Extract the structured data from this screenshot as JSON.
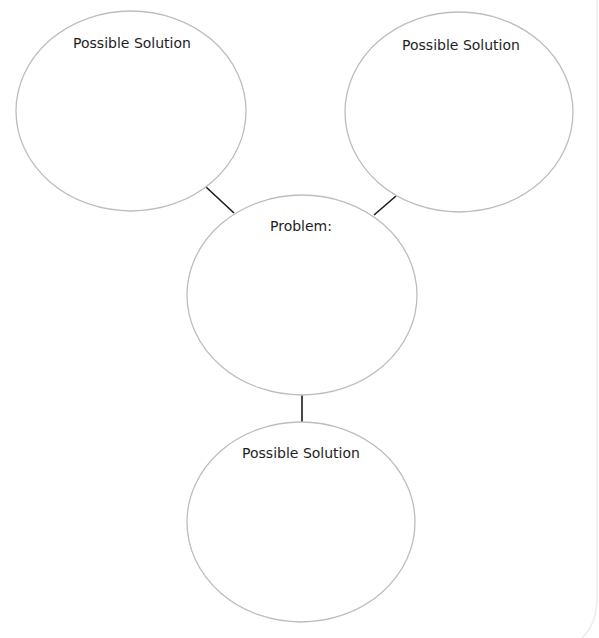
{
  "diagram": {
    "type": "problem-solution-web",
    "center_node": {
      "label": "Problem:",
      "cx": 302,
      "cy": 295,
      "rx": 115,
      "ry": 100
    },
    "solution_nodes": [
      {
        "id": "top-left",
        "label": "Possible Solution",
        "cx": 131,
        "cy": 111,
        "rx": 115,
        "ry": 100
      },
      {
        "id": "top-right",
        "label": "Possible Solution",
        "cx": 459,
        "cy": 112,
        "rx": 114,
        "ry": 100
      },
      {
        "id": "bottom",
        "label": "Possible Solution",
        "cx": 301,
        "cy": 522,
        "rx": 114,
        "ry": 100
      }
    ],
    "connectors": [
      {
        "from": "top-left",
        "x1": 206,
        "y1": 187,
        "x2": 234,
        "y2": 213
      },
      {
        "from": "top-right",
        "x1": 396,
        "y1": 196,
        "x2": 374,
        "y2": 215
      },
      {
        "from": "bottom",
        "x1": 302,
        "y1": 395,
        "x2": 302,
        "y2": 422
      }
    ],
    "colors": {
      "ellipse_stroke": "#bdbdbd",
      "connector": "#1a1a1a",
      "text": "#1e1e1e",
      "page_edge": "#ececec"
    }
  }
}
